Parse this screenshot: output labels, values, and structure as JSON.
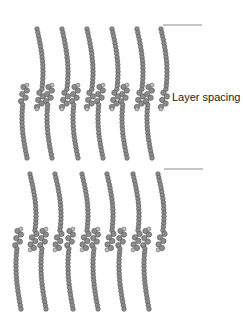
{
  "diagram": {
    "label": "Layer spacing",
    "label_pos": {
      "x": 172,
      "y": 91
    },
    "spacing_lines": [
      {
        "x1": 163,
        "x2": 202,
        "y": 25
      },
      {
        "x1": 164,
        "x2": 203,
        "y": 169
      }
    ],
    "colors": {
      "bead_fill": "#8c8c8c",
      "bead_stroke": "#555555",
      "head_fill": "#bdbdbd",
      "line": "#8a8a8a",
      "background": "#ffffff"
    },
    "layers": [
      {
        "name": "upper-bilayer",
        "top_leaflet": {
          "x": [
            37,
            62,
            87,
            112,
            137,
            161
          ],
          "y_top": 29,
          "y_bottom": 107,
          "bend": 6
        },
        "bottom_leaflet": {
          "x": [
            27,
            52,
            78,
            103,
            127,
            152
          ],
          "y_top": 87,
          "y_bottom": 158,
          "bend": -5
        }
      },
      {
        "name": "lower-bilayer",
        "top_leaflet": {
          "x": [
            30,
            55,
            82,
            107,
            133,
            158
          ],
          "y_top": 174,
          "y_bottom": 248,
          "bend": 6
        },
        "bottom_leaflet": {
          "x": [
            21,
            46,
            73,
            98,
            124,
            149
          ],
          "y_top": 231,
          "y_bottom": 309,
          "bend": -5
        }
      }
    ]
  }
}
